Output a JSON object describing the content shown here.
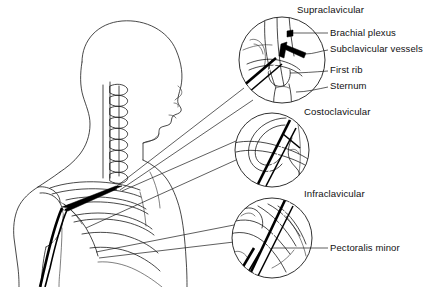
{
  "figure": {
    "background_color": "#ffffff",
    "line_color": "#1a1a1a",
    "nerve_color": "#000000",
    "width": 436,
    "height": 287
  },
  "insets": [
    {
      "id": "supraclavicular",
      "title": "Supraclavicular",
      "title_x": 297,
      "title_y": 9,
      "circle": {
        "cx": 282,
        "cy": 60,
        "r": 43
      },
      "callouts": [
        {
          "label": "Brachial plexus",
          "x": 330,
          "y": 33
        },
        {
          "label": "Subclavicular vessels",
          "x": 330,
          "y": 49
        },
        {
          "label": "First rib",
          "x": 330,
          "y": 70
        },
        {
          "label": "Sternum",
          "x": 330,
          "y": 86
        }
      ]
    },
    {
      "id": "costoclavicular",
      "title": "Costoclavicular",
      "title_x": 304,
      "title_y": 110,
      "circle": {
        "cx": 272,
        "cy": 150,
        "r": 37
      },
      "callouts": []
    },
    {
      "id": "infraclavicular",
      "title": "Infraclavicular",
      "title_x": 304,
      "title_y": 192,
      "circle": {
        "cx": 272,
        "cy": 238,
        "r": 40
      },
      "callouts": [
        {
          "label": "Pectoralis minor",
          "x": 330,
          "y": 245
        }
      ]
    }
  ],
  "labels": {
    "supraclavicular": "Supraclavicular",
    "brachial_plexus": "Brachial plexus",
    "subclavicular_vessels": "Subclavicular vessels",
    "first_rib": "First rib",
    "sternum": "Sternum",
    "costoclavicular": "Costoclavicular",
    "infraclavicular": "Infraclavicular",
    "pectoralis_minor": "Pectoralis minor"
  }
}
